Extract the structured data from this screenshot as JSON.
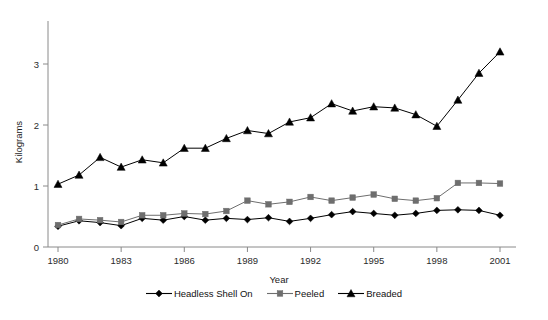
{
  "chart_data": {
    "type": "line",
    "title": "",
    "xlabel": "Year",
    "ylabel": "Kilograms",
    "xlim": [
      1980,
      2001
    ],
    "ylim": [
      0,
      3.4
    ],
    "xticks": [
      1980,
      1983,
      1986,
      1989,
      1992,
      1995,
      1998,
      2001
    ],
    "xtick_labels": [
      "1980",
      "1983",
      "1986",
      "1989",
      "1992",
      "1995",
      "1998",
      "2001"
    ],
    "yticks": [
      0,
      1,
      2,
      3
    ],
    "ytick_labels": [
      "0",
      "1",
      "2",
      "3"
    ],
    "grid": false,
    "legend_position": "bottom",
    "x": [
      1980,
      1981,
      1982,
      1983,
      1984,
      1985,
      1986,
      1987,
      1988,
      1989,
      1990,
      1991,
      1992,
      1993,
      1994,
      1995,
      1996,
      1997,
      1998,
      1999,
      2000,
      2001
    ],
    "series": [
      {
        "name": "Headless Shell On",
        "marker": "diamond",
        "color": "#000000",
        "values": [
          0.34,
          0.43,
          0.4,
          0.35,
          0.47,
          0.44,
          0.5,
          0.44,
          0.47,
          0.45,
          0.48,
          0.42,
          0.47,
          0.53,
          0.58,
          0.55,
          0.52,
          0.55,
          0.6,
          0.61,
          0.6,
          0.52
        ]
      },
      {
        "name": "Peeled",
        "marker": "square",
        "color": "#6e6e6e",
        "values": [
          0.36,
          0.46,
          0.44,
          0.41,
          0.52,
          0.52,
          0.55,
          0.54,
          0.59,
          0.76,
          0.7,
          0.74,
          0.82,
          0.76,
          0.81,
          0.86,
          0.79,
          0.76,
          0.8,
          1.05,
          1.05,
          1.04
        ]
      },
      {
        "name": "Breaded",
        "marker": "triangle",
        "color": "#000000",
        "values": [
          1.03,
          1.18,
          1.47,
          1.31,
          1.43,
          1.38,
          1.62,
          1.62,
          1.78,
          1.91,
          1.86,
          2.05,
          2.12,
          2.35,
          2.23,
          2.3,
          2.28,
          2.17,
          1.98,
          2.41,
          2.85,
          3.2
        ]
      }
    ]
  },
  "legend": {
    "items": [
      {
        "label": "Headless Shell On",
        "marker": "diamond",
        "color": "#000000"
      },
      {
        "label": "Peeled",
        "marker": "square",
        "color": "#6e6e6e"
      },
      {
        "label": "Breaded",
        "marker": "triangle",
        "color": "#000000"
      }
    ]
  }
}
